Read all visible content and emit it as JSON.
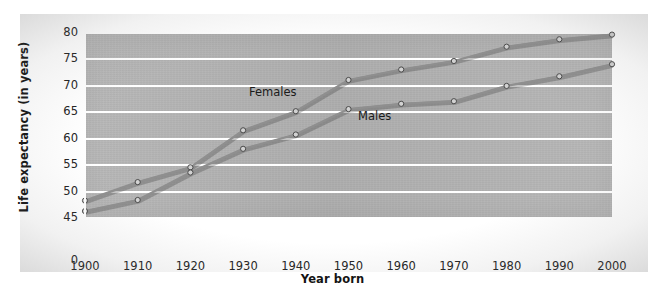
{
  "chart_data": {
    "type": "line",
    "title": "",
    "xlabel": "Year born",
    "ylabel": "Life expectancy (in years)",
    "x": [
      1900,
      1910,
      1920,
      1930,
      1940,
      1950,
      1960,
      1970,
      1980,
      1990,
      2000
    ],
    "xtick_labels": [
      "1900",
      "1910",
      "1920",
      "1930",
      "1940",
      "1950",
      "1960",
      "1970",
      "1980",
      "1990",
      "2000"
    ],
    "ytick_labels": [
      "0",
      "45",
      "50",
      "55",
      "60",
      "65",
      "70",
      "75",
      "80"
    ],
    "ytick_values": [
      0,
      45,
      50,
      55,
      60,
      65,
      70,
      75,
      80
    ],
    "ylim": [
      45,
      80
    ],
    "xlim": [
      1900,
      2000
    ],
    "axis_break": true,
    "axis_break_note": "y-axis broken between 0 and 45",
    "grid": true,
    "grid_color": "#ffffff",
    "legend": "inline-labels",
    "plot_background": "#b4b4b4",
    "series": [
      {
        "name": "Females",
        "color": "#8f8f8f",
        "marker": "circle",
        "values": [
          48.3,
          51.8,
          54.6,
          61.6,
          65.2,
          71.1,
          73.1,
          74.7,
          77.4,
          78.8,
          79.7
        ]
      },
      {
        "name": "Males",
        "color": "#8f8f8f",
        "marker": "circle",
        "values": [
          46.3,
          48.4,
          53.6,
          58.1,
          60.8,
          65.6,
          66.6,
          67.1,
          70.0,
          71.8,
          74.1
        ]
      }
    ]
  },
  "labels": {
    "females": "Females",
    "males": "Males",
    "x_axis_title": "Year born",
    "y_axis_title": "Life expectancy (in years)"
  }
}
